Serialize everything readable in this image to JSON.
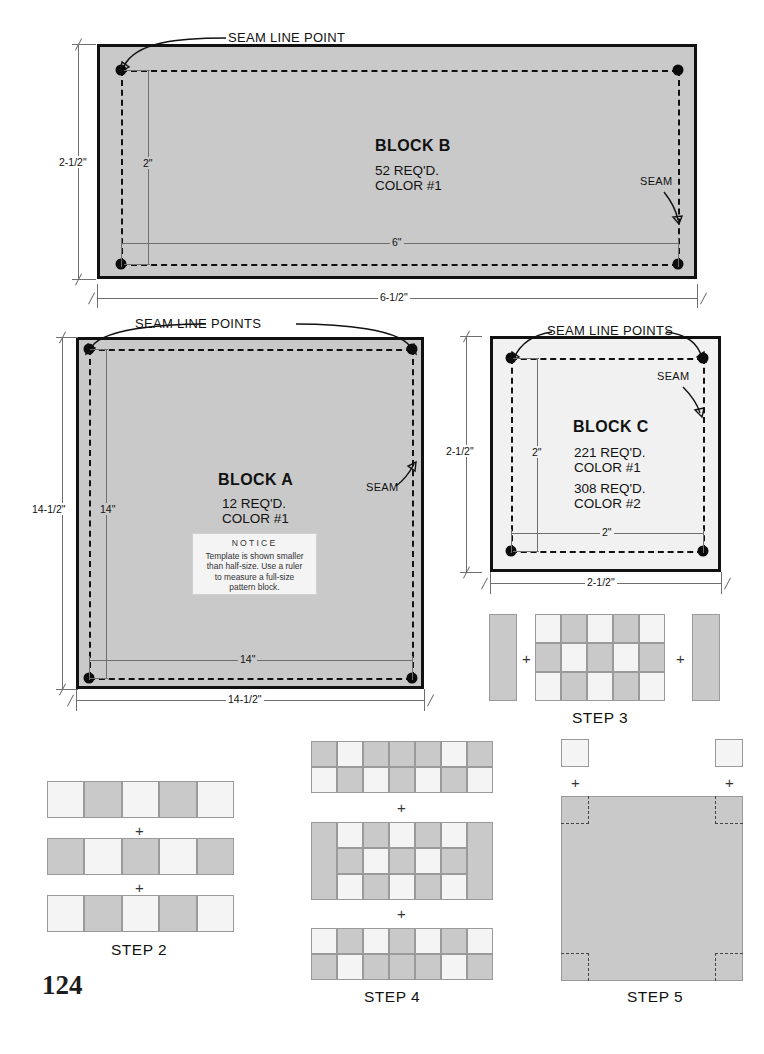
{
  "page": {
    "number": "124",
    "colors": {
      "fabric_color_1_gray": "#c9c9c9",
      "fabric_color_2_white": "#f4f4f4",
      "block_c_fill": "#f1f1f1",
      "outline": "#111111",
      "measure_line": "#6f6f6f"
    }
  },
  "blocks": {
    "b": {
      "title": "BLOCK B",
      "qty": "52 REQ'D.",
      "color": "COLOR #1",
      "callout_seam_line_point": "SEAM LINE POINT",
      "callout_seam": "SEAM",
      "dim_height_outer": "2-1/2\"",
      "dim_height_inner": "2\"",
      "dim_width_inner": "6\"",
      "dim_width_outer": "6-1/2\""
    },
    "a": {
      "title": "BLOCK A",
      "qty": "12 REQ'D.",
      "color": "COLOR #1",
      "callout_seam_line_points": "SEAM LINE POINTS",
      "callout_seam": "SEAM",
      "dim_height_outer": "14-1/2\"",
      "dim_height_inner": "14\"",
      "dim_width_inner": "14\"",
      "dim_width_outer": "14-1/2\"",
      "notice": {
        "heading": "NOTICE",
        "line1": "Template is shown smaller",
        "line2": "than half-size. Use a ruler",
        "line3": "to measure a full-size",
        "line4": "pattern block."
      }
    },
    "c": {
      "title": "BLOCK C",
      "qty1": "221 REQ'D.",
      "color1": "COLOR #1",
      "qty2": "308 REQ'D.",
      "color2": "COLOR #2",
      "callout_seam_line_points": "SEAM LINE POINTS",
      "callout_seam": "SEAM",
      "dim_height_outer": "2-1/2\"",
      "dim_height_inner": "2\"",
      "dim_width_inner": "2\"",
      "dim_width_outer": "2-1/2\""
    }
  },
  "steps": {
    "step2": {
      "label": "STEP 2",
      "plus": "+",
      "rows": [
        [
          "w",
          "g",
          "w",
          "g",
          "w"
        ],
        [
          "g",
          "w",
          "g",
          "w",
          "g"
        ],
        [
          "w",
          "g",
          "w",
          "g",
          "w"
        ]
      ]
    },
    "step3": {
      "label": "STEP 3",
      "plus": "+",
      "left_bar": "g",
      "right_bar": "g",
      "center_rows": [
        [
          "w",
          "g",
          "w",
          "g",
          "w"
        ],
        [
          "g",
          "w",
          "g",
          "w",
          "g"
        ],
        [
          "w",
          "g",
          "w",
          "g",
          "w"
        ]
      ]
    },
    "step4": {
      "label": "STEP 4",
      "plus": "+",
      "top_rows": [
        [
          "g",
          "w",
          "g",
          "g",
          "g",
          "w",
          "g"
        ],
        [
          "w",
          "g",
          "w",
          "g",
          "w",
          "g",
          "w"
        ]
      ],
      "middle_left_bar": "g",
      "middle_right_bar": "g",
      "middle_rows": [
        [
          "w",
          "g",
          "w",
          "g",
          "w"
        ],
        [
          "g",
          "w",
          "g",
          "w",
          "g"
        ],
        [
          "w",
          "g",
          "w",
          "g",
          "w"
        ]
      ],
      "bottom_rows": [
        [
          "w",
          "g",
          "w",
          "g",
          "w",
          "g",
          "w"
        ],
        [
          "g",
          "w",
          "g",
          "g",
          "g",
          "w",
          "g"
        ]
      ]
    },
    "step5": {
      "label": "STEP 5",
      "plus": "+",
      "corner_square_left": "w",
      "corner_square_right": "w",
      "big_square": "g"
    }
  }
}
